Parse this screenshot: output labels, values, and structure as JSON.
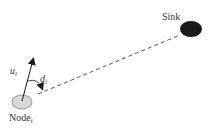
{
  "diagram": {
    "sink": {
      "label": "Sink",
      "color": "#1a1a1a"
    },
    "node": {
      "label_base": "Node",
      "label_sub": "i",
      "color": "#d9d9d9"
    },
    "vector": {
      "label_base": "u",
      "label_sub": "i"
    },
    "angle": {
      "label_base": "d",
      "label_sub": "i"
    },
    "link_style": "dashed"
  }
}
